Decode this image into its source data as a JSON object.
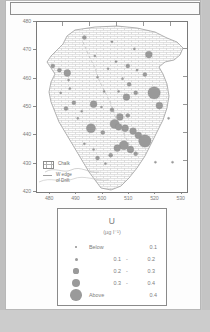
{
  "figure": {
    "map": {
      "y_axis": {
        "ticks": [
          480,
          470,
          460,
          450,
          440,
          430,
          420
        ],
        "min": 420,
        "max": 480
      },
      "x_axis": {
        "ticks": [
          480,
          490,
          500,
          510,
          520,
          530
        ],
        "min": 475,
        "max": 532
      },
      "inner_key": [
        {
          "symbol": "chalk-hatch-swatch",
          "label": "Chalk"
        },
        {
          "symbol": "drift-line-swatch",
          "label": "W edge\nof Drift"
        }
      ],
      "inner_key_chalk": "Chalk",
      "inner_key_drift_line1": "W edge",
      "inner_key_drift_line2": "of Drift"
    },
    "legend": {
      "title": "U",
      "units": "(µg l⁻¹)",
      "classes": [
        {
          "size_px": 1.6,
          "low": "",
          "dash": "",
          "high": "0.1",
          "word": "Below"
        },
        {
          "size_px": 3.0,
          "low": "0.1",
          "dash": "-",
          "high": "0.2",
          "word": ""
        },
        {
          "size_px": 5.2,
          "low": "0.2",
          "dash": "-",
          "high": "0.3",
          "word": ""
        },
        {
          "size_px": 8.2,
          "low": "0.3",
          "dash": "-",
          "high": "0.4",
          "word": ""
        },
        {
          "size_px": 11.6,
          "low": "",
          "dash": "",
          "high": "0.4",
          "word": "Above"
        }
      ]
    }
  },
  "colors": {
    "symbol_gray": "#9a9a9a",
    "frame_gray": "#7a7a7a",
    "text_gray": "#7d7d7d",
    "page_gray": "#c9c9c9"
  },
  "chart_data": {
    "type": "scatter",
    "title": "U",
    "subtitle": "(µg l⁻¹)",
    "xlabel": "",
    "ylabel": "",
    "xlim": [
      475,
      532
    ],
    "ylim": [
      420,
      480
    ],
    "grid": false,
    "legend_position": "below-plot",
    "symbol_encoding": "area-proportional-circle",
    "legend_entries": [
      "Below 0.1",
      "0.1 - 0.2",
      "0.2 - 0.3",
      "0.3 - 0.4",
      "Above 0.4"
    ],
    "map_overlays": [
      "Chalk",
      "W edge of Drift"
    ],
    "points": [
      {
        "x": 493.0,
        "y": 474.5,
        "size": 2
      },
      {
        "x": 503.5,
        "y": 473.0,
        "size": 1
      },
      {
        "x": 512.0,
        "y": 470.5,
        "size": 1
      },
      {
        "x": 517.5,
        "y": 468.5,
        "size": 3
      },
      {
        "x": 505.0,
        "y": 466.0,
        "size": 1
      },
      {
        "x": 509.5,
        "y": 464.5,
        "size": 2
      },
      {
        "x": 513.0,
        "y": 463.0,
        "size": 1
      },
      {
        "x": 516.0,
        "y": 461.5,
        "size": 2
      },
      {
        "x": 481.0,
        "y": 464.5,
        "size": 2
      },
      {
        "x": 483.5,
        "y": 463.0,
        "size": 2
      },
      {
        "x": 486.5,
        "y": 462.0,
        "size": 3
      },
      {
        "x": 487.0,
        "y": 459.5,
        "size": 1
      },
      {
        "x": 498.0,
        "y": 460.5,
        "size": 1
      },
      {
        "x": 507.5,
        "y": 460.0,
        "size": 1
      },
      {
        "x": 510.0,
        "y": 458.0,
        "size": 2
      },
      {
        "x": 506.0,
        "y": 455.5,
        "size": 1
      },
      {
        "x": 509.0,
        "y": 453.5,
        "size": 3
      },
      {
        "x": 512.5,
        "y": 455.0,
        "size": 2
      },
      {
        "x": 519.5,
        "y": 455.0,
        "size": 5
      },
      {
        "x": 521.5,
        "y": 450.5,
        "size": 3
      },
      {
        "x": 489.0,
        "y": 451.5,
        "size": 2
      },
      {
        "x": 496.5,
        "y": 451.0,
        "size": 3
      },
      {
        "x": 499.5,
        "y": 450.0,
        "size": 1
      },
      {
        "x": 503.5,
        "y": 449.0,
        "size": 2
      },
      {
        "x": 506.5,
        "y": 446.5,
        "size": 3
      },
      {
        "x": 509.5,
        "y": 447.0,
        "size": 2
      },
      {
        "x": 504.5,
        "y": 444.0,
        "size": 4
      },
      {
        "x": 506.0,
        "y": 443.0,
        "size": 3
      },
      {
        "x": 508.5,
        "y": 442.5,
        "size": 3
      },
      {
        "x": 511.5,
        "y": 441.5,
        "size": 3
      },
      {
        "x": 513.5,
        "y": 440.0,
        "size": 3
      },
      {
        "x": 495.5,
        "y": 442.5,
        "size": 4
      },
      {
        "x": 500.0,
        "y": 441.0,
        "size": 2
      },
      {
        "x": 516.0,
        "y": 438.0,
        "size": 5
      },
      {
        "x": 508.0,
        "y": 436.5,
        "size": 4
      },
      {
        "x": 505.5,
        "y": 435.5,
        "size": 3
      },
      {
        "x": 510.5,
        "y": 435.0,
        "size": 3
      },
      {
        "x": 512.5,
        "y": 433.5,
        "size": 2
      },
      {
        "x": 503.0,
        "y": 433.0,
        "size": 2
      },
      {
        "x": 498.0,
        "y": 432.0,
        "size": 2
      },
      {
        "x": 490.5,
        "y": 446.0,
        "size": 1
      },
      {
        "x": 492.0,
        "y": 448.5,
        "size": 1
      },
      {
        "x": 486.0,
        "y": 449.5,
        "size": 2
      },
      {
        "x": 484.0,
        "y": 455.0,
        "size": 1
      },
      {
        "x": 487.5,
        "y": 456.5,
        "size": 1
      },
      {
        "x": 500.5,
        "y": 455.5,
        "size": 1
      },
      {
        "x": 502.0,
        "y": 463.5,
        "size": 1
      },
      {
        "x": 497.0,
        "y": 468.0,
        "size": 1
      },
      {
        "x": 520.0,
        "y": 430.5,
        "size": 1
      },
      {
        "x": 526.5,
        "y": 430.5,
        "size": 1
      },
      {
        "x": 525.0,
        "y": 446.0,
        "size": 1
      },
      {
        "x": 493.0,
        "y": 437.0,
        "size": 1
      },
      {
        "x": 496.5,
        "y": 435.0,
        "size": 1
      },
      {
        "x": 501.0,
        "y": 430.0,
        "size": 1
      }
    ]
  }
}
